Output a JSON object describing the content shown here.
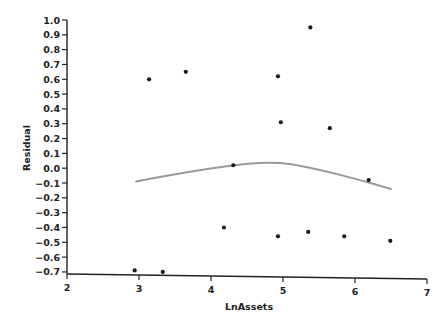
{
  "chart_data": {
    "type": "scatter",
    "title": "",
    "xlabel": "LnAssets",
    "ylabel": "Residual",
    "xlim": [
      2,
      7
    ],
    "ylim": [
      -0.7,
      1.0
    ],
    "x_ticks": [
      2,
      3,
      4,
      5,
      6,
      7
    ],
    "y_ticks": [
      1.0,
      0.9,
      0.8,
      0.7,
      0.6,
      0.5,
      0.4,
      0.3,
      0.2,
      0.1,
      0.0,
      -0.1,
      -0.2,
      -0.3,
      -0.4,
      -0.5,
      -0.6,
      -0.7
    ],
    "x_tick_labels": [
      "2",
      "3",
      "4",
      "5",
      "6",
      "7"
    ],
    "y_tick_labels": [
      "1.0",
      "0.9",
      "0.8",
      "0.7",
      "0.6",
      "0.5",
      "0.4",
      "0.3",
      "0.2",
      "0.1",
      "0.0",
      "−0.1",
      "−0.2",
      "−0.3",
      "−0.4",
      "−0.5",
      "−0.6",
      "−0.7"
    ],
    "grid": false,
    "legend": null,
    "series": [
      {
        "name": "Residuals",
        "kind": "scatter",
        "color": "#1a1a1a",
        "points": [
          {
            "x": 2.94,
            "y": -0.69
          },
          {
            "x": 3.14,
            "y": 0.6
          },
          {
            "x": 3.33,
            "y": -0.7
          },
          {
            "x": 3.65,
            "y": 0.65
          },
          {
            "x": 4.18,
            "y": -0.4
          },
          {
            "x": 4.31,
            "y": 0.02
          },
          {
            "x": 4.93,
            "y": 0.62
          },
          {
            "x": 4.93,
            "y": -0.46
          },
          {
            "x": 4.97,
            "y": 0.31
          },
          {
            "x": 5.35,
            "y": -0.43
          },
          {
            "x": 5.38,
            "y": 0.95
          },
          {
            "x": 5.65,
            "y": 0.27
          },
          {
            "x": 5.85,
            "y": -0.46
          },
          {
            "x": 6.19,
            "y": -0.08
          },
          {
            "x": 6.49,
            "y": -0.49
          }
        ]
      },
      {
        "name": "Smoothed fit",
        "kind": "line",
        "color": "#9a9a9a",
        "points": [
          {
            "x": 2.96,
            "y": -0.09
          },
          {
            "x": 3.5,
            "y": -0.04
          },
          {
            "x": 4.0,
            "y": 0.0
          },
          {
            "x": 4.5,
            "y": 0.03
          },
          {
            "x": 4.8,
            "y": 0.04
          },
          {
            "x": 5.1,
            "y": 0.03
          },
          {
            "x": 5.5,
            "y": -0.01
          },
          {
            "x": 6.0,
            "y": -0.07
          },
          {
            "x": 6.5,
            "y": -0.14
          }
        ]
      }
    ]
  }
}
